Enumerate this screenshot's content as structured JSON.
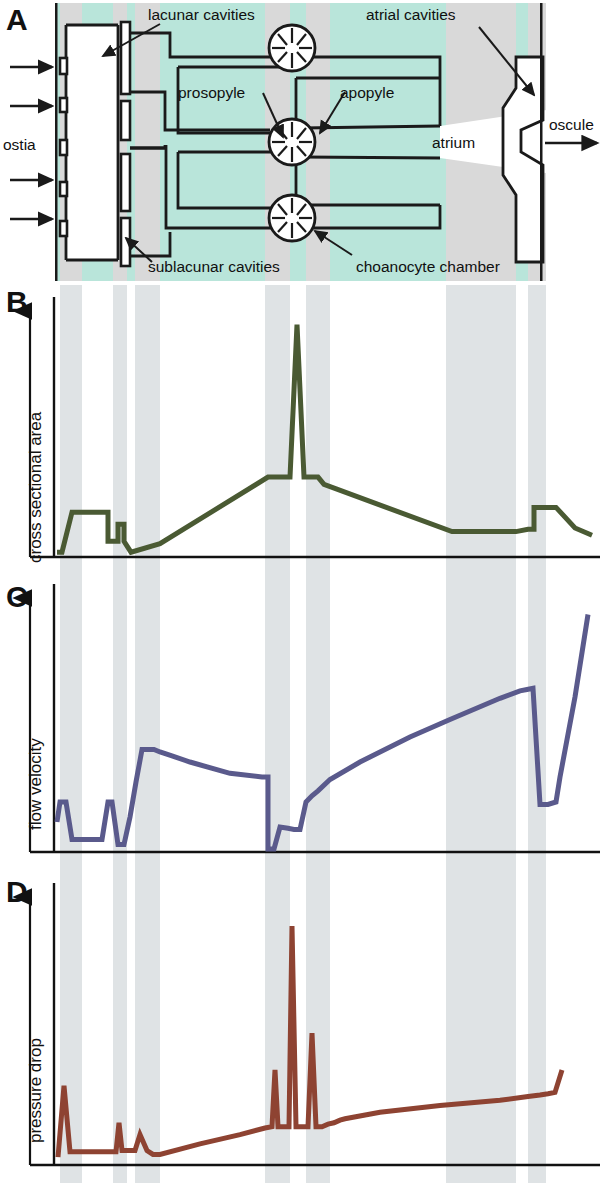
{
  "figure": {
    "width": 607,
    "height": 1183,
    "background": "#ffffff"
  },
  "panelA": {
    "letter": "A",
    "background_color": "#b9e5da",
    "shading_color": "#d9d9d9",
    "line_color": "#1a1a1a",
    "labels": {
      "lacunar_cavities": "lacunar cavities",
      "atrial_cavities": "atrial cavities",
      "prosopyle": "prosopyle",
      "apopyle": "apopyle",
      "ostia": "ostia",
      "atrium": "atrium",
      "oscule": "oscule",
      "sublacunar_cavities": "sublacunar cavities",
      "choanocyte_chamber": "choanocyte chamber"
    },
    "inflow_arrow_count": 4,
    "choanocyte_chamber_count": 3,
    "ostia_count": 6
  },
  "panelB": {
    "letter": "B",
    "axis_label": "cross sectional area",
    "line_color": "#4a5a33"
  },
  "panelC": {
    "letter": "C",
    "axis_label": "flow velocity",
    "line_color": "#5a5a8c"
  },
  "panelD": {
    "letter": "D",
    "axis_label": "pressure drop",
    "line_color": "#8e4332"
  },
  "shaded_bands": [
    {
      "x0": 60,
      "x1": 82
    },
    {
      "x0": 113,
      "x1": 127
    },
    {
      "x0": 135,
      "x1": 160
    },
    {
      "x0": 265,
      "x1": 290
    },
    {
      "x0": 306,
      "x1": 330
    },
    {
      "x0": 446,
      "x1": 516
    },
    {
      "x0": 528,
      "x1": 546
    }
  ],
  "chart_data": [
    {
      "type": "line",
      "panel": "B",
      "title": "cross sectional area",
      "ylabel": "cross sectional area",
      "xlabel": "",
      "axis_range_x": [
        55,
        600
      ],
      "axis_range_y": [
        0,
        1
      ],
      "grid": false,
      "legend": "none",
      "color": "#4a5a33",
      "x": [
        57,
        62,
        72,
        82,
        88,
        88,
        100,
        108,
        108,
        113,
        113,
        118,
        118,
        124,
        124,
        131,
        160,
        268,
        290,
        297,
        304,
        318,
        324,
        452,
        516,
        528,
        534,
        534,
        552,
        556,
        575,
        592
      ],
      "y": [
        0.02,
        0.02,
        0.185,
        0.185,
        0.185,
        0.185,
        0.185,
        0.185,
        0.065,
        0.065,
        0.065,
        0.065,
        0.135,
        0.135,
        0.065,
        0.02,
        0.055,
        0.33,
        0.33,
        0.96,
        0.33,
        0.33,
        0.3,
        0.105,
        0.105,
        0.115,
        0.115,
        0.205,
        0.205,
        0.205,
        0.12,
        0.09
      ]
    },
    {
      "type": "line",
      "panel": "C",
      "title": "flow velocity",
      "ylabel": "flow velocity",
      "xlabel": "",
      "axis_range_x": [
        55,
        600
      ],
      "axis_range_y": [
        0,
        1
      ],
      "grid": false,
      "legend": "none",
      "color": "#5a5a8c",
      "x": [
        57,
        60,
        66,
        72,
        72,
        84,
        90,
        96,
        102,
        108,
        112,
        118,
        124,
        130,
        136,
        142,
        148,
        154,
        160,
        172,
        190,
        230,
        262,
        268,
        268,
        274,
        280,
        288,
        294,
        300,
        300,
        306,
        312,
        318,
        330,
        360,
        410,
        450,
        500,
        520,
        527,
        533,
        540,
        548,
        556,
        560,
        575,
        588
      ],
      "y": [
        0.12,
        0.2,
        0.2,
        0.05,
        0.05,
        0.05,
        0.05,
        0.05,
        0.05,
        0.2,
        0.2,
        0.03,
        0.03,
        0.14,
        0.28,
        0.41,
        0.41,
        0.41,
        0.4,
        0.385,
        0.36,
        0.315,
        0.3,
        0.3,
        0.012,
        0.012,
        0.1,
        0.095,
        0.09,
        0.09,
        0.09,
        0.2,
        0.225,
        0.245,
        0.29,
        0.36,
        0.46,
        0.53,
        0.615,
        0.645,
        0.65,
        0.655,
        0.19,
        0.19,
        0.2,
        0.3,
        0.62,
        0.95
      ]
    },
    {
      "type": "line",
      "panel": "D",
      "title": "pressure drop",
      "ylabel": "pressure drop",
      "xlabel": "",
      "axis_range_x": [
        55,
        600
      ],
      "axis_range_y": [
        0,
        1
      ],
      "grid": false,
      "legend": "none",
      "color": "#8e4332",
      "x": [
        58,
        64,
        70,
        76,
        110,
        116,
        119,
        122,
        125,
        135,
        140,
        147,
        153,
        160,
        200,
        240,
        265,
        272,
        275,
        278,
        284,
        289,
        292,
        296,
        300,
        305,
        308,
        312,
        316,
        322,
        328,
        334,
        340,
        345,
        380,
        440,
        500,
        528,
        540,
        548,
        555,
        562
      ],
      "y": [
        0.03,
        0.3,
        0.05,
        0.05,
        0.05,
        0.05,
        0.16,
        0.055,
        0.055,
        0.055,
        0.115,
        0.055,
        0.04,
        0.04,
        0.08,
        0.115,
        0.14,
        0.145,
        0.36,
        0.145,
        0.145,
        0.145,
        0.905,
        0.145,
        0.145,
        0.145,
        0.145,
        0.5,
        0.145,
        0.145,
        0.155,
        0.16,
        0.17,
        0.175,
        0.2,
        0.225,
        0.245,
        0.26,
        0.265,
        0.27,
        0.275,
        0.36
      ]
    }
  ]
}
